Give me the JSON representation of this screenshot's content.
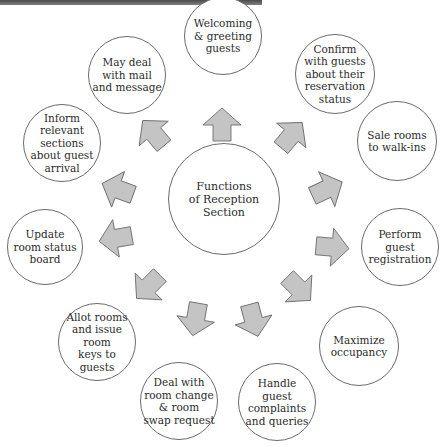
{
  "diagram": {
    "title_partial": "",
    "center": {
      "label": "Functions\nof Reception\nSection"
    },
    "functions": [
      {
        "id": "welcoming",
        "label": "Welcoming\n& greeting\nguests"
      },
      {
        "id": "confirm",
        "label": "Confirm\nwith guests\nabout their\nreservation\nstatus"
      },
      {
        "id": "sale",
        "label": "Sale rooms\nto walk-ins"
      },
      {
        "id": "perform",
        "label": "Perform\nguest\nregistration"
      },
      {
        "id": "maximize",
        "label": "Maximize\noccupancy"
      },
      {
        "id": "handle",
        "label": "Handle\nguest\ncomplaints\nand queries"
      },
      {
        "id": "deal",
        "label": "Deal with\nroom change\n& room\nswap request"
      },
      {
        "id": "allot",
        "label": "Allot rooms\nand issue\nroom\nkeys to\nguests"
      },
      {
        "id": "update",
        "label": "Update\nroom status\nboard"
      },
      {
        "id": "inform",
        "label": "Inform\nrelevant\nsections\nabout guest\narrival"
      },
      {
        "id": "mail",
        "label": "May deal\nwith mail\nand message"
      }
    ],
    "colors": {
      "arrow_fill": "#c4c4c4",
      "arrow_stroke": "#6e6e6e",
      "circle_stroke": "#6b6b6b"
    }
  }
}
